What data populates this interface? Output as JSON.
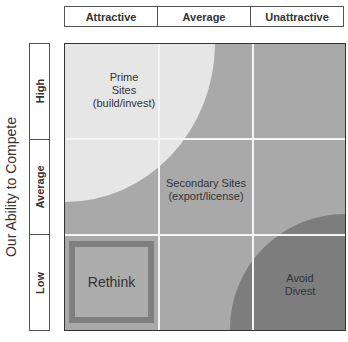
{
  "column_header": {
    "label": "Market Attractiveness",
    "items": [
      "Attractive",
      "Average",
      "Unattractive"
    ]
  },
  "row_header": {
    "items": [
      "High",
      "Average",
      "Low"
    ]
  },
  "y_axis_label": "Our Ability to Compete",
  "regions": {
    "prime": {
      "line1": "Prime",
      "line2": "Sites",
      "line3": "(build/invest)"
    },
    "secondary": {
      "line1": "Secondary Sites",
      "line2": "(export/license)"
    },
    "rethink": {
      "label": "Rethink"
    },
    "avoid": {
      "line1": "Avoid",
      "line2": "Divest"
    }
  },
  "colors": {
    "prime": "#e6e6e6",
    "secondary": "#a9a9a9",
    "avoid": "#7d7d7d",
    "rethink_border": "#7f7f7f",
    "gridline": "#f4f4f4"
  }
}
